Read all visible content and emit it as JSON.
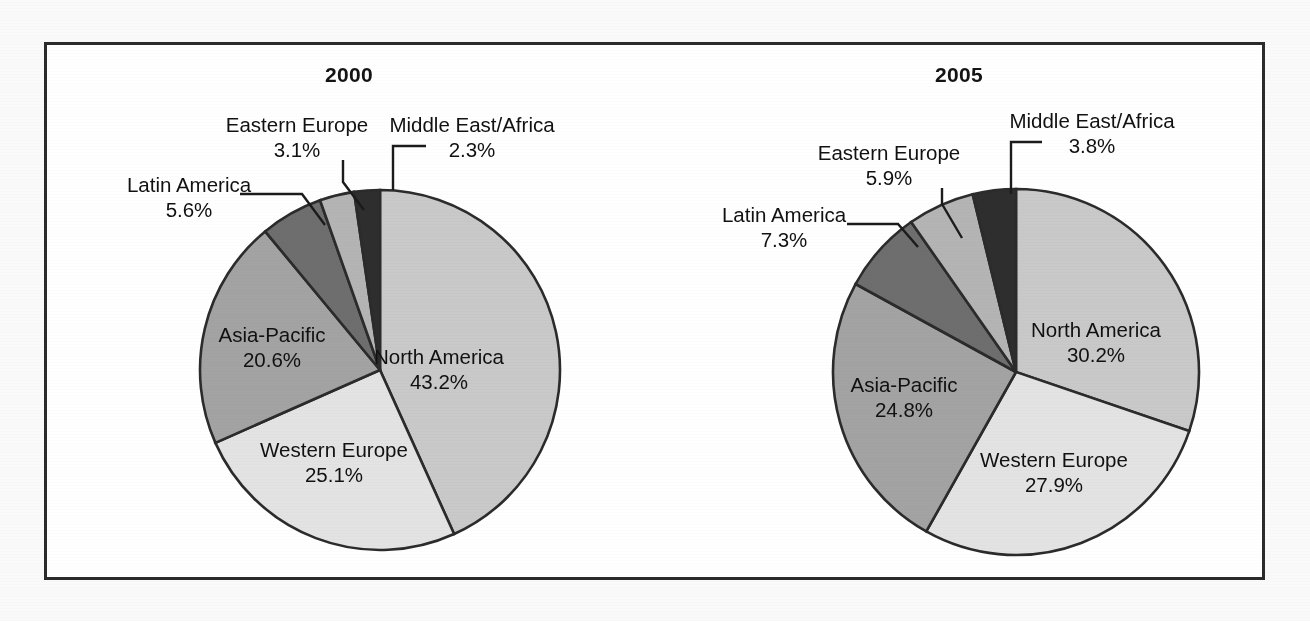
{
  "page": {
    "background": "#fafafa",
    "frame_color": "#2b2b2b"
  },
  "chart_data": [
    {
      "type": "pie",
      "title": "2000",
      "categories": [
        "North America",
        "Western Europe",
        "Asia-Pacific",
        "Latin America",
        "Eastern Europe",
        "Middle East/Africa"
      ],
      "values": [
        43.2,
        25.1,
        20.6,
        5.6,
        3.1,
        2.3
      ],
      "value_labels": [
        "43.2%",
        "25.1%",
        "20.6%",
        "5.6%",
        "3.1%",
        "2.3%"
      ],
      "colors": [
        "#c9c9c9",
        "#e3e3e3",
        "#a3a3a3",
        "#6e6e6e",
        "#b4b4b4",
        "#2e2e2e"
      ],
      "start_angle_deg": 0,
      "direction": "counterclockwise",
      "units": "percent",
      "legend": "none",
      "grid": false,
      "label_placement": [
        "inside",
        "inside",
        "inside",
        "outside-leader",
        "outside-leader",
        "outside-leader"
      ]
    },
    {
      "type": "pie",
      "title": "2005",
      "categories": [
        "North America",
        "Western Europe",
        "Asia-Pacific",
        "Latin America",
        "Eastern Europe",
        "Middle East/Africa"
      ],
      "values": [
        30.2,
        27.9,
        24.8,
        7.3,
        5.9,
        3.8
      ],
      "value_labels": [
        "30.2%",
        "27.9%",
        "24.8%",
        "7.3%",
        "5.9%",
        "3.8%"
      ],
      "colors": [
        "#c9c9c9",
        "#e3e3e3",
        "#a3a3a3",
        "#6e6e6e",
        "#b4b4b4",
        "#2e2e2e"
      ],
      "start_angle_deg": 0,
      "direction": "counterclockwise",
      "units": "percent",
      "legend": "none",
      "grid": false,
      "label_placement": [
        "inside",
        "inside",
        "inside",
        "outside-leader",
        "outside-leader",
        "outside-leader"
      ]
    }
  ],
  "panels": [
    {
      "title": "2000",
      "geometry": {
        "cx": 336,
        "cy": 328,
        "r": 180
      },
      "labels": [
        {
          "name": "north-america",
          "category": "North America",
          "value": "43.2%",
          "x": 395,
          "y": 322,
          "anchor": "middle",
          "kind": "inside"
        },
        {
          "name": "western-europe",
          "category": "Western Europe",
          "value": "25.1%",
          "x": 290,
          "y": 415,
          "anchor": "middle",
          "kind": "inside"
        },
        {
          "name": "asia-pacific",
          "category": "Asia-Pacific",
          "value": "20.6%",
          "x": 228,
          "y": 300,
          "anchor": "middle",
          "kind": "inside"
        },
        {
          "name": "latin-america",
          "category": "Latin America",
          "value": "5.6%",
          "x": 145,
          "y": 150,
          "anchor": "middle",
          "kind": "outside"
        },
        {
          "name": "eastern-europe",
          "category": "Eastern Europe",
          "value": "3.1%",
          "x": 253,
          "y": 90,
          "anchor": "middle",
          "kind": "outside"
        },
        {
          "name": "middle-east-africa",
          "category": "Middle East/Africa",
          "value": "2.3%",
          "x": 428,
          "y": 90,
          "anchor": "middle",
          "kind": "outside"
        }
      ],
      "leaders": [
        {
          "name": "latin-america-leader",
          "points": "196,152 258,152 281,183"
        },
        {
          "name": "eastern-europe-leader",
          "points": "299,118 299,140 320,168"
        },
        {
          "name": "middle-east-africa-leader",
          "points": "382,104 349,104 349,148"
        }
      ]
    },
    {
      "title": "2005",
      "geometry": {
        "cx": 362,
        "cy": 330,
        "r": 183
      },
      "labels": [
        {
          "name": "north-america",
          "category": "North America",
          "value": "30.2%",
          "x": 442,
          "y": 295,
          "anchor": "middle",
          "kind": "inside"
        },
        {
          "name": "western-europe",
          "category": "Western Europe",
          "value": "27.9%",
          "x": 400,
          "y": 425,
          "anchor": "middle",
          "kind": "inside"
        },
        {
          "name": "asia-pacific",
          "category": "Asia-Pacific",
          "value": "24.8%",
          "x": 250,
          "y": 350,
          "anchor": "middle",
          "kind": "inside"
        },
        {
          "name": "latin-america",
          "category": "Latin America",
          "value": "7.3%",
          "x": 130,
          "y": 180,
          "anchor": "middle",
          "kind": "outside"
        },
        {
          "name": "eastern-europe",
          "category": "Eastern Europe",
          "value": "5.9%",
          "x": 235,
          "y": 118,
          "anchor": "middle",
          "kind": "outside"
        },
        {
          "name": "middle-east-africa",
          "category": "Middle East/Africa",
          "value": "3.8%",
          "x": 438,
          "y": 86,
          "anchor": "middle",
          "kind": "outside"
        }
      ],
      "leaders": [
        {
          "name": "latin-america-leader",
          "points": "193,182 244,182 264,205"
        },
        {
          "name": "eastern-europe-leader",
          "points": "288,146 288,162 308,196"
        },
        {
          "name": "middle-east-africa-leader",
          "points": "388,100 357,100 357,152"
        }
      ]
    }
  ]
}
